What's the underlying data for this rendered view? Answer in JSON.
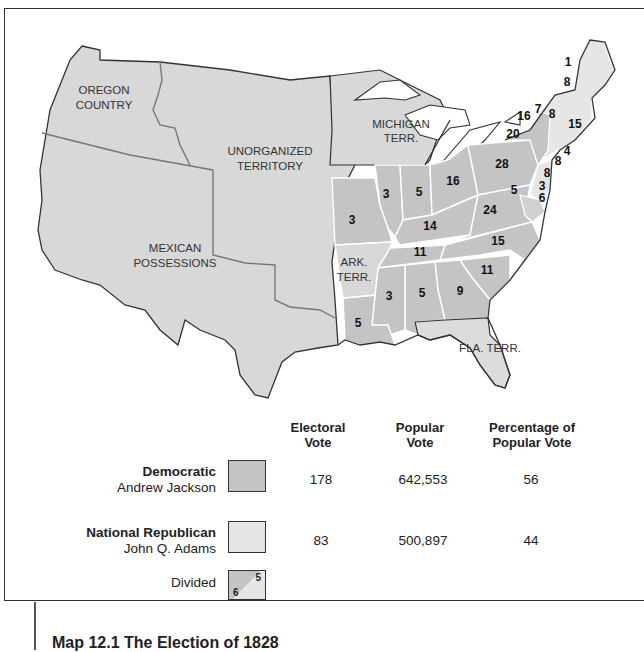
{
  "map": {
    "regions": [
      {
        "name": "oregon-country",
        "label_lines": [
          "OREGON",
          "COUNTRY"
        ]
      },
      {
        "name": "unorganized-territory",
        "label_lines": [
          "UNORGANIZED",
          "TERRITORY"
        ]
      },
      {
        "name": "mexican-possessions",
        "label_lines": [
          "MEXICAN",
          "POSSESSIONS"
        ]
      },
      {
        "name": "michigan-territory",
        "label_lines": [
          "MICHIGAN",
          "TERR."
        ]
      },
      {
        "name": "arkansas-territory",
        "label_lines": [
          "ARK.",
          "TERR."
        ]
      },
      {
        "name": "florida-territory",
        "label_lines": [
          "FLA. TERR."
        ]
      }
    ],
    "state_votes": {
      "maine_north": "1",
      "maine": "8",
      "new_york": "16",
      "vermont": "7",
      "new_hampshire": "8",
      "massachusetts": "15",
      "new_york_west": "20",
      "rhode_island": "4",
      "connecticut": "8",
      "new_jersey": "8",
      "pennsylvania": "28",
      "delaware": "3",
      "maryland_a": "5",
      "maryland_b": "6",
      "ohio": "16",
      "indiana": "5",
      "illinois": "3",
      "missouri": "3",
      "kentucky": "14",
      "virginia": "24",
      "north_carolina": "15",
      "tennessee": "11",
      "south_carolina": "11",
      "georgia": "9",
      "alabama": "5",
      "mississippi": "3",
      "louisiana": "5"
    }
  },
  "legend": {
    "headers": {
      "electoral": [
        "Electoral",
        "Vote"
      ],
      "popular": [
        "Popular",
        "Vote"
      ],
      "percentage": [
        "Percentage of",
        "Popular Vote"
      ]
    },
    "rows": [
      {
        "party": "Democratic",
        "candidate": "Andrew Jackson",
        "electoral": "178",
        "popular": "642,553",
        "percentage": "56",
        "color": "#c4c4c4"
      },
      {
        "party": "National Republican",
        "candidate": "John Q. Adams",
        "electoral": "83",
        "popular": "500,897",
        "percentage": "44",
        "color": "#e6e6e6"
      }
    ],
    "divided": {
      "label": "Divided",
      "a": "5",
      "b": "6"
    }
  },
  "caption": "Map 12.1  The Election of 1828",
  "colors": {
    "territory": "#d8d8d8",
    "democratic": "#c4c4c4",
    "national_republican": "#e6e6e6",
    "border": "#333333"
  }
}
